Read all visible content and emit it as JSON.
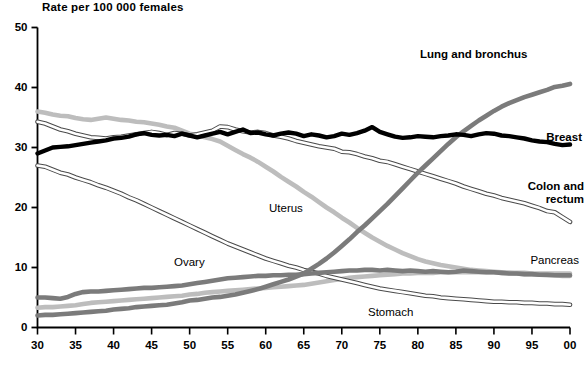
{
  "figure": {
    "axis_title": "Rate per 100 000 females",
    "footnote": ""
  },
  "chart_data": {
    "type": "line",
    "title": "Rate per 100 000 females",
    "xlabel": "",
    "ylabel": "Rate per 100 000 females",
    "xlim": [
      1930,
      2000
    ],
    "ylim": [
      0,
      50
    ],
    "grid": false,
    "legend_position": "inline-labels",
    "x_tick_labels": [
      "30",
      "35",
      "40",
      "45",
      "50",
      "55",
      "60",
      "65",
      "70",
      "75",
      "80",
      "85",
      "90",
      "95",
      "00"
    ],
    "x_tick_values": [
      1930,
      1935,
      1940,
      1945,
      1950,
      1955,
      1960,
      1965,
      1970,
      1975,
      1980,
      1985,
      1990,
      1995,
      2000
    ],
    "y_tick_labels": [
      "0",
      "10",
      "20",
      "30",
      "40",
      "50"
    ],
    "y_tick_values": [
      0,
      10,
      20,
      30,
      40,
      50
    ],
    "x": [
      1930,
      1931,
      1932,
      1933,
      1934,
      1935,
      1936,
      1937,
      1938,
      1939,
      1940,
      1941,
      1942,
      1943,
      1944,
      1945,
      1946,
      1947,
      1948,
      1949,
      1950,
      1951,
      1952,
      1953,
      1954,
      1955,
      1956,
      1957,
      1958,
      1959,
      1960,
      1961,
      1962,
      1963,
      1964,
      1965,
      1966,
      1967,
      1968,
      1969,
      1970,
      1971,
      1972,
      1973,
      1974,
      1975,
      1976,
      1977,
      1978,
      1979,
      1980,
      1981,
      1982,
      1983,
      1984,
      1985,
      1986,
      1987,
      1988,
      1989,
      1990,
      1991,
      1992,
      1993,
      1994,
      1995,
      1996,
      1997,
      1998,
      1999,
      2000
    ],
    "series": [
      {
        "name": "Lung and bronchus",
        "label": "Lung and bronchus",
        "color": "#7b7b7b",
        "style": "thick-solid",
        "values": [
          2.0,
          2.1,
          2.1,
          2.2,
          2.3,
          2.4,
          2.5,
          2.6,
          2.7,
          2.8,
          3.0,
          3.1,
          3.2,
          3.4,
          3.5,
          3.6,
          3.7,
          3.8,
          4.0,
          4.2,
          4.5,
          4.6,
          4.8,
          5.0,
          5.1,
          5.3,
          5.5,
          5.8,
          6.1,
          6.4,
          6.8,
          7.2,
          7.6,
          8.0,
          8.5,
          9.0,
          9.8,
          10.6,
          11.5,
          12.5,
          13.6,
          14.7,
          15.9,
          17.0,
          18.2,
          19.4,
          20.6,
          21.9,
          23.2,
          24.5,
          25.8,
          27.0,
          28.2,
          29.4,
          30.6,
          31.7,
          32.7,
          33.6,
          34.5,
          35.3,
          36.1,
          36.8,
          37.4,
          37.9,
          38.4,
          38.8,
          39.2,
          39.6,
          40.1,
          40.3,
          40.6
        ]
      },
      {
        "name": "Breast",
        "label": "Breast",
        "color": "#000000",
        "style": "thick-solid",
        "values": [
          29.0,
          29.5,
          30.0,
          30.1,
          30.2,
          30.4,
          30.6,
          30.8,
          31.0,
          31.2,
          31.5,
          31.6,
          31.8,
          32.2,
          32.4,
          32.1,
          32.0,
          32.1,
          31.9,
          32.3,
          32.0,
          31.7,
          32.0,
          32.3,
          32.6,
          32.2,
          32.6,
          33.0,
          32.4,
          32.5,
          32.2,
          32.0,
          32.3,
          32.5,
          32.3,
          31.9,
          32.2,
          32.0,
          31.7,
          31.9,
          32.3,
          32.1,
          32.4,
          32.8,
          33.4,
          32.6,
          32.2,
          31.8,
          31.6,
          31.7,
          31.9,
          31.8,
          31.7,
          31.9,
          32.0,
          32.2,
          32.1,
          31.9,
          32.2,
          32.4,
          32.3,
          32.0,
          31.9,
          31.7,
          31.5,
          31.2,
          31.0,
          30.9,
          30.6,
          30.4,
          30.5
        ]
      },
      {
        "name": "Colon and rectum",
        "label": "Colon and rectum",
        "color": "#ffffff",
        "style": "outlined",
        "values": [
          34.3,
          34.0,
          33.5,
          33.0,
          32.7,
          32.3,
          32.0,
          31.7,
          31.6,
          31.5,
          31.7,
          31.8,
          32.0,
          32.2,
          32.4,
          32.6,
          32.4,
          32.1,
          32.4,
          32.3,
          32.0,
          32.2,
          32.5,
          32.8,
          33.5,
          33.4,
          33.0,
          32.7,
          32.5,
          32.6,
          32.4,
          32.0,
          31.8,
          31.5,
          31.1,
          30.8,
          30.5,
          30.2,
          30.0,
          29.8,
          29.3,
          29.2,
          28.9,
          28.5,
          28.2,
          27.8,
          27.6,
          27.2,
          26.8,
          26.4,
          26.0,
          25.6,
          25.2,
          24.8,
          24.4,
          24.0,
          23.5,
          23.1,
          22.7,
          22.3,
          22.0,
          21.6,
          21.3,
          21.0,
          20.7,
          20.3,
          19.9,
          19.4,
          19.2,
          18.4,
          17.6
        ]
      },
      {
        "name": "Uterus",
        "label": "Uterus",
        "color": "#bdbdbd",
        "style": "thick-solid",
        "values": [
          36.0,
          35.8,
          35.5,
          35.3,
          35.2,
          34.9,
          34.7,
          34.6,
          34.8,
          35.0,
          34.8,
          34.6,
          34.5,
          34.3,
          34.2,
          34.0,
          33.8,
          33.5,
          33.3,
          32.8,
          32.3,
          32.1,
          31.7,
          31.4,
          31.0,
          30.3,
          29.6,
          28.9,
          28.3,
          27.6,
          26.8,
          26.0,
          25.1,
          24.3,
          23.5,
          22.6,
          21.8,
          20.9,
          20.0,
          19.2,
          18.3,
          17.5,
          16.6,
          15.8,
          15.0,
          14.3,
          13.6,
          13.0,
          12.4,
          11.9,
          11.4,
          11.0,
          10.7,
          10.4,
          10.2,
          10.0,
          9.8,
          9.6,
          9.5,
          9.4,
          9.3,
          9.2,
          9.1,
          9.0,
          8.9,
          8.9,
          8.8,
          8.7,
          8.7,
          8.6,
          8.6
        ]
      },
      {
        "name": "Ovary",
        "label": "Ovary",
        "color": "#7b7b7b",
        "style": "thick-solid",
        "values": [
          5.0,
          5.0,
          4.9,
          4.8,
          5.1,
          5.6,
          5.9,
          6.0,
          6.0,
          6.1,
          6.2,
          6.3,
          6.4,
          6.5,
          6.6,
          6.6,
          6.7,
          6.8,
          6.9,
          7.0,
          7.2,
          7.4,
          7.6,
          7.8,
          8.0,
          8.2,
          8.3,
          8.4,
          8.5,
          8.6,
          8.6,
          8.7,
          8.7,
          8.8,
          8.8,
          8.9,
          9.0,
          9.1,
          9.2,
          9.3,
          9.4,
          9.5,
          9.5,
          9.6,
          9.6,
          9.5,
          9.6,
          9.5,
          9.4,
          9.5,
          9.4,
          9.3,
          9.4,
          9.3,
          9.2,
          9.3,
          9.5,
          9.4,
          9.3,
          9.2,
          9.2,
          9.1,
          9.0,
          9.0,
          8.9,
          8.9,
          8.8,
          8.8,
          8.7,
          8.7,
          8.7
        ]
      },
      {
        "name": "Pancreas",
        "label": "Pancreas",
        "color": "#bdbdbd",
        "style": "thick-solid",
        "values": [
          3.3,
          3.4,
          3.4,
          3.5,
          3.6,
          3.7,
          3.9,
          4.1,
          4.2,
          4.3,
          4.4,
          4.5,
          4.6,
          4.7,
          4.8,
          4.9,
          5.0,
          5.1,
          5.2,
          5.3,
          5.5,
          5.6,
          5.8,
          5.9,
          6.0,
          6.1,
          6.2,
          6.3,
          6.4,
          6.5,
          6.6,
          6.7,
          6.8,
          6.9,
          7.0,
          7.1,
          7.3,
          7.5,
          7.7,
          7.9,
          8.1,
          8.3,
          8.4,
          8.5,
          8.6,
          8.7,
          8.8,
          8.9,
          9.0,
          9.0,
          9.1,
          9.1,
          9.1,
          9.2,
          9.2,
          9.2,
          9.2,
          9.2,
          9.2,
          9.2,
          9.2,
          9.1,
          9.1,
          9.1,
          9.1,
          9.0,
          9.0,
          9.0,
          9.0,
          9.0,
          9.0
        ]
      },
      {
        "name": "Stomach",
        "label": "Stomach",
        "color": "#ffffff",
        "style": "outlined",
        "values": [
          27.0,
          26.8,
          26.3,
          25.8,
          25.5,
          25.0,
          24.6,
          24.2,
          23.7,
          23.3,
          22.8,
          22.3,
          21.7,
          21.2,
          20.6,
          20.0,
          19.4,
          18.8,
          18.2,
          17.6,
          17.0,
          16.4,
          15.8,
          15.2,
          14.6,
          14.0,
          13.5,
          13.0,
          12.5,
          12.0,
          11.5,
          11.1,
          10.7,
          10.3,
          10.0,
          9.6,
          9.3,
          9.0,
          8.6,
          8.3,
          8.0,
          7.7,
          7.4,
          7.1,
          6.8,
          6.5,
          6.3,
          6.1,
          5.9,
          5.7,
          5.5,
          5.3,
          5.2,
          5.0,
          4.9,
          4.8,
          4.7,
          4.6,
          4.5,
          4.4,
          4.3,
          4.3,
          4.2,
          4.2,
          4.1,
          4.1,
          4.0,
          4.0,
          3.9,
          3.9,
          3.8
        ]
      }
    ],
    "annotations": [
      {
        "text": "Lung and bronchus",
        "x": 420,
        "y": 48,
        "weight": "bold"
      },
      {
        "text": "Breast",
        "x": 534,
        "y": 131,
        "weight": "bold"
      },
      {
        "text": "Colon and",
        "x": 536,
        "y": 180,
        "weight": "bold"
      },
      {
        "text": "rectum",
        "x": 536,
        "y": 193,
        "weight": "bold"
      },
      {
        "text": "Uterus",
        "x": 269,
        "y": 202,
        "weight": "normal"
      },
      {
        "text": "Ovary",
        "x": 174,
        "y": 256,
        "weight": "normal"
      },
      {
        "text": "Pancreas",
        "x": 531,
        "y": 254,
        "weight": "normal"
      },
      {
        "text": "Stomach",
        "x": 368,
        "y": 306,
        "weight": "normal"
      }
    ]
  }
}
